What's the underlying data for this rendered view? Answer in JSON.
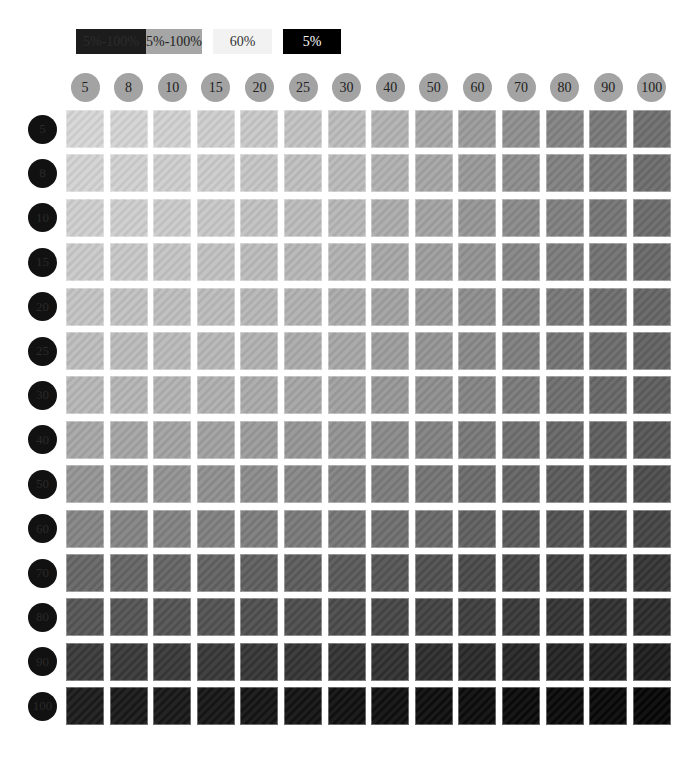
{
  "legend": [
    {
      "label": "5%-100%",
      "bg": "#1c1c1c",
      "color": "#2c2c2c",
      "left": 76,
      "width": 70
    },
    {
      "label": "5%-100%",
      "bg": "#a6a6a6",
      "color": "#222222",
      "left": 146,
      "width": 56
    },
    {
      "label": "60%",
      "bg": "#f2f2f2",
      "color": "#333333",
      "left": 213,
      "width": 59
    },
    {
      "label": "5%",
      "bg": "#000000",
      "color": "#ffffff",
      "left": 283,
      "width": 58
    }
  ],
  "chart_data": {
    "type": "heatmap",
    "title": "",
    "x_labels": [
      "5",
      "8",
      "10",
      "15",
      "20",
      "25",
      "30",
      "40",
      "50",
      "60",
      "70",
      "80",
      "90",
      "100"
    ],
    "y_labels": [
      "5",
      "8",
      "10",
      "15",
      "20",
      "25",
      "30",
      "40",
      "50",
      "60",
      "70",
      "80",
      "90",
      "100"
    ],
    "xlabel": "column tint %",
    "ylabel": "row tint %",
    "legend": [
      "5%-100%",
      "5%-100%",
      "60%",
      "5%"
    ],
    "value_description": "gray level per cell; darkens to the right (column %) and downward (row %)",
    "corner_colors": {
      "top_left": "#d6d6d6",
      "top_right": "#6f6f6f",
      "bottom_left": "#1b1b1b",
      "bottom_right": "#050505"
    },
    "row_left_colors": [
      "#d6d6d6",
      "#d3d3d3",
      "#cfcfcf",
      "#c9c9c9",
      "#c3c3c3",
      "#bdbdbd",
      "#b6b6b6",
      "#a6a6a6",
      "#959595",
      "#858585",
      "#666666",
      "#555555",
      "#3a3a3a",
      "#1b1b1b"
    ],
    "col_top_colors": [
      "#d6d6d6",
      "#d4d4d4",
      "#d1d1d1",
      "#cecece",
      "#c8c8c8",
      "#c2c2c2",
      "#bcbcbc",
      "#b2b2b2",
      "#a7a7a7",
      "#9b9b9b",
      "#8f8f8f",
      "#838383",
      "#797979",
      "#6f6f6f"
    ]
  }
}
